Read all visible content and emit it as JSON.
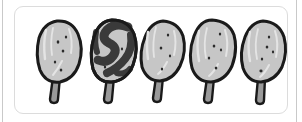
{
  "illustration": {
    "title": "Five hand-drawn popsicles",
    "description": "A row of five sketched ice-cream bars on sticks inside a rounded white panel",
    "panel": {
      "background_color": "#ffffff",
      "border_color": "#dcdcdc"
    },
    "page_rules": {
      "color": "#c9c9c9",
      "count": 2
    },
    "palette": {
      "outline": "#1a1a1a",
      "body_fill": "#c6c6c6",
      "body_highlight": "#e2e2e2",
      "swirl_dark": "#3a3a3a",
      "stick_fill": "#9a9a9a",
      "speckle": "#2b2b2b"
    },
    "items": [
      {
        "index": 1,
        "name": "popsicle-plain-1",
        "label": "Popsicle 1",
        "pattern": "plain",
        "fill_color": "#c6c6c6",
        "x": 18,
        "speckles": 5
      },
      {
        "index": 2,
        "name": "popsicle-swirl",
        "label": "Popsicle 2",
        "pattern": "swirl",
        "fill_color": "#3a3a3a",
        "x": 72,
        "speckles": 2
      },
      {
        "index": 3,
        "name": "popsicle-plain-3",
        "label": "Popsicle 3",
        "pattern": "plain",
        "fill_color": "#c6c6c6",
        "x": 122,
        "speckles": 4
      },
      {
        "index": 4,
        "name": "popsicle-plain-4",
        "label": "Popsicle 4",
        "pattern": "plain",
        "fill_color": "#c6c6c6",
        "x": 172,
        "speckles": 5
      },
      {
        "index": 5,
        "name": "popsicle-plain-5",
        "label": "Popsicle 5",
        "pattern": "plain",
        "fill_color": "#c6c6c6",
        "x": 222,
        "speckles": 5
      }
    ]
  }
}
